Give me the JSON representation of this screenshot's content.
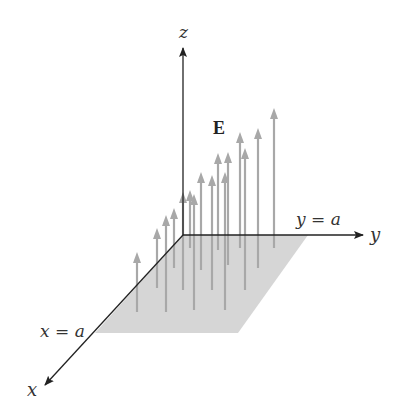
{
  "diagram": {
    "type": "3d-vector-field",
    "labels": {
      "z_axis": "z",
      "y_axis": "y",
      "x_axis": "x",
      "y_bound": "y = a",
      "x_bound": "x = a",
      "field": "E"
    },
    "colors": {
      "axis": "#222222",
      "plate": "#d6d6d6",
      "arrow": "#a8a8a8",
      "background": "#ffffff"
    },
    "origin": [
      183,
      235
    ],
    "axes": {
      "z_end": [
        183,
        48
      ],
      "y_end": [
        363,
        235
      ],
      "x_end": [
        45,
        385
      ]
    },
    "plate": [
      [
        183,
        235
      ],
      [
        308,
        235
      ],
      [
        238,
        333
      ],
      [
        95,
        333
      ]
    ],
    "arrows": [
      {
        "x": 137,
        "top": 252,
        "bottom": 312
      },
      {
        "x": 157,
        "top": 228,
        "bottom": 288
      },
      {
        "x": 166,
        "top": 215,
        "bottom": 312
      },
      {
        "x": 174,
        "top": 208,
        "bottom": 268
      },
      {
        "x": 183,
        "top": 192,
        "bottom": 290
      },
      {
        "x": 190,
        "top": 190,
        "bottom": 248
      },
      {
        "x": 194,
        "top": 194,
        "bottom": 310
      },
      {
        "x": 201,
        "top": 172,
        "bottom": 270
      },
      {
        "x": 212,
        "top": 175,
        "bottom": 290
      },
      {
        "x": 218,
        "top": 153,
        "bottom": 250
      },
      {
        "x": 225,
        "top": 172,
        "bottom": 310
      },
      {
        "x": 228,
        "top": 152,
        "bottom": 265
      },
      {
        "x": 240,
        "top": 132,
        "bottom": 248
      },
      {
        "x": 245,
        "top": 148,
        "bottom": 290
      },
      {
        "x": 258,
        "top": 128,
        "bottom": 268
      },
      {
        "x": 274,
        "top": 108,
        "bottom": 248
      }
    ]
  }
}
